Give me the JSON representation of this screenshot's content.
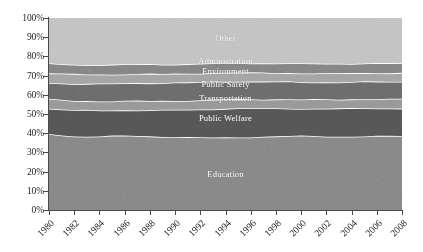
{
  "chart_data": {
    "type": "area",
    "stacked": true,
    "normalized": true,
    "title": "",
    "xlabel": "",
    "ylabel": "",
    "grid": false,
    "legend_position": "inline-labels",
    "ylim": [
      0,
      100
    ],
    "ytick_labels": [
      "0%",
      "10%",
      "20%",
      "30%",
      "40%",
      "50%",
      "60%",
      "70%",
      "80%",
      "90%",
      "100%"
    ],
    "ytick_values": [
      0,
      10,
      20,
      30,
      40,
      50,
      60,
      70,
      80,
      90,
      100
    ],
    "xtick_labels": [
      "1980",
      "1982",
      "1984",
      "1986",
      "1988",
      "1990",
      "1992",
      "1994",
      "1996",
      "1998",
      "2000",
      "2002",
      "2004",
      "2006",
      "2008"
    ],
    "x": [
      1980,
      1981,
      1982,
      1983,
      1984,
      1985,
      1986,
      1987,
      1988,
      1989,
      1990,
      1991,
      1992,
      1993,
      1994,
      1995,
      1996,
      1997,
      1998,
      1999,
      2000,
      2001,
      2002,
      2003,
      2004,
      2005,
      2006,
      2007,
      2008
    ],
    "series": [
      {
        "name": "Education",
        "color": "#8a8a8a",
        "values": [
          39.6,
          39.0,
          38.4,
          38.2,
          38.3,
          38.5,
          38.7,
          38.6,
          38.4,
          38.2,
          38.0,
          37.8,
          37.7,
          37.7,
          37.8,
          37.9,
          38.0,
          38.1,
          38.3,
          38.5,
          38.6,
          38.6,
          38.4,
          38.2,
          38.2,
          38.3,
          38.4,
          38.5,
          38.6
        ]
      },
      {
        "name": "Public Welfare",
        "color": "#585858",
        "values": [
          13.2,
          13.4,
          13.6,
          13.8,
          13.6,
          13.4,
          13.3,
          13.4,
          13.6,
          13.8,
          14.1,
          14.4,
          14.7,
          14.9,
          15.0,
          15.0,
          14.9,
          14.8,
          14.6,
          14.4,
          14.2,
          14.2,
          14.4,
          14.6,
          14.7,
          14.7,
          14.6,
          14.5,
          14.4
        ]
      },
      {
        "name": "Transportation",
        "color": "#9a9a9a",
        "values": [
          4.9,
          4.9,
          4.9,
          4.8,
          4.8,
          4.8,
          4.8,
          4.8,
          4.8,
          4.8,
          4.8,
          4.8,
          4.8,
          4.8,
          4.8,
          4.8,
          4.8,
          4.8,
          4.8,
          4.8,
          4.8,
          4.8,
          4.8,
          4.8,
          4.8,
          4.8,
          4.8,
          4.8,
          4.8
        ]
      },
      {
        "name": "Public Safety",
        "color": "#6e6e6e",
        "values": [
          8.6,
          8.7,
          8.8,
          8.9,
          9.0,
          9.1,
          9.2,
          9.3,
          9.4,
          9.4,
          9.4,
          9.4,
          9.4,
          9.4,
          9.3,
          9.3,
          9.2,
          9.2,
          9.1,
          9.1,
          9.0,
          9.0,
          9.0,
          9.0,
          9.0,
          9.0,
          9.0,
          9.0,
          9.0
        ]
      },
      {
        "name": "Environment",
        "color": "#a6a6a6",
        "values": [
          5.0,
          5.0,
          5.0,
          4.9,
          4.9,
          4.8,
          4.8,
          4.7,
          4.7,
          4.6,
          4.6,
          4.6,
          4.6,
          4.6,
          4.6,
          4.6,
          4.6,
          4.6,
          4.6,
          4.6,
          4.6,
          4.6,
          4.6,
          4.6,
          4.6,
          4.6,
          4.6,
          4.6,
          4.6
        ]
      },
      {
        "name": "Administration",
        "color": "#878787",
        "values": [
          5.0,
          5.0,
          5.0,
          5.0,
          5.0,
          5.0,
          5.0,
          5.0,
          5.0,
          5.0,
          5.0,
          5.0,
          5.0,
          5.0,
          5.0,
          5.0,
          5.0,
          5.0,
          5.0,
          5.0,
          5.0,
          5.0,
          5.0,
          5.0,
          5.0,
          5.0,
          5.0,
          5.0,
          5.0
        ]
      },
      {
        "name": "Other",
        "color": "#c4c4c4",
        "values": [
          23.7,
          24.0,
          24.3,
          24.4,
          24.4,
          24.4,
          24.2,
          24.2,
          24.1,
          24.2,
          24.1,
          24.0,
          23.8,
          23.6,
          23.5,
          23.4,
          23.5,
          23.5,
          23.6,
          23.6,
          23.8,
          23.8,
          23.8,
          23.8,
          23.7,
          23.6,
          23.6,
          23.6,
          23.6
        ]
      }
    ],
    "band_labels": [
      {
        "name": "Other",
        "x_pct": 50,
        "y_pct": 89.5
      },
      {
        "name": "Administration",
        "x_pct": 50,
        "y_pct": 77.5
      },
      {
        "name": "Environment",
        "x_pct": 50,
        "y_pct": 72.5
      },
      {
        "name": "Public Safety",
        "x_pct": 50,
        "y_pct": 65.5
      },
      {
        "name": "Transportation",
        "x_pct": 50,
        "y_pct": 58.5
      },
      {
        "name": "Public Welfare",
        "x_pct": 50,
        "y_pct": 48.0
      },
      {
        "name": "Education",
        "x_pct": 50,
        "y_pct": 19.0
      }
    ],
    "separator_color": "#ffffff",
    "axis_color": "#4a4a4a",
    "label_text_color": "#ffffff"
  }
}
